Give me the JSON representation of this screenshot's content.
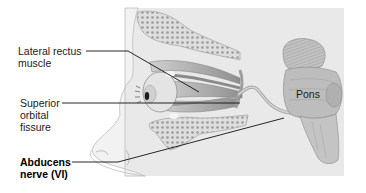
{
  "figure": {
    "labels": {
      "lateral_rectus": {
        "line1": "Lateral rectus",
        "line2": "muscle"
      },
      "superior_orbital_fissure": {
        "line1": "Superior",
        "line2": "orbital",
        "line3": "fissure"
      },
      "abducens_nerve": {
        "line1": "Abducens",
        "line2": "nerve (VI)"
      },
      "pons": "Pons"
    },
    "colors": {
      "panel_bg": "#e9e9e9",
      "skin": "#f0f0f0",
      "bone": "#dcdcdc",
      "bone_dots": "#9a9a9a",
      "muscle": "#a8a8a8",
      "brainstem": "#b9b9b9",
      "leader_line": "#111111"
    }
  }
}
